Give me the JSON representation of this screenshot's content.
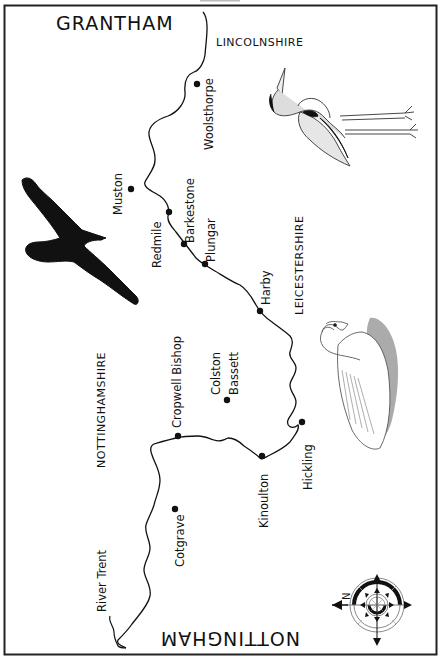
{
  "map": {
    "cities": {
      "top": "GRANTHAM",
      "bottom": "NOTTINGHAM"
    },
    "counties": [
      {
        "id": "lincolnshire",
        "label": "LINCOLNSHIRE"
      },
      {
        "id": "leicestershire",
        "label": "LEICESTERSHIRE"
      },
      {
        "id": "nottinghamshire",
        "label": "NOTTINGHAMSHIRE"
      }
    ],
    "river_label": "River Trent",
    "towns": [
      {
        "id": "woolsthorpe",
        "label": "Woolsthorpe"
      },
      {
        "id": "muston",
        "label": "Muston"
      },
      {
        "id": "redmile",
        "label": "Redmile"
      },
      {
        "id": "barkestone",
        "label": "Barkestone"
      },
      {
        "id": "plungar",
        "label": "Plungar"
      },
      {
        "id": "harby",
        "label": "Harby"
      },
      {
        "id": "colston-bassett-1",
        "label": "Colston"
      },
      {
        "id": "colston-bassett-2",
        "label": "Bassett"
      },
      {
        "id": "cropwell-bishop",
        "label": "Cropwell Bishop"
      },
      {
        "id": "hickling",
        "label": "Hickling"
      },
      {
        "id": "kinoulton",
        "label": "Kinoulton"
      },
      {
        "id": "cotgrave",
        "label": "Cotgrave"
      }
    ],
    "compass": {
      "north_letter": "N"
    },
    "illustrations": [
      "heron",
      "crow",
      "swan"
    ],
    "colors": {
      "ink": "#111111",
      "paper": "#ffffff",
      "shade": "#888888"
    }
  }
}
